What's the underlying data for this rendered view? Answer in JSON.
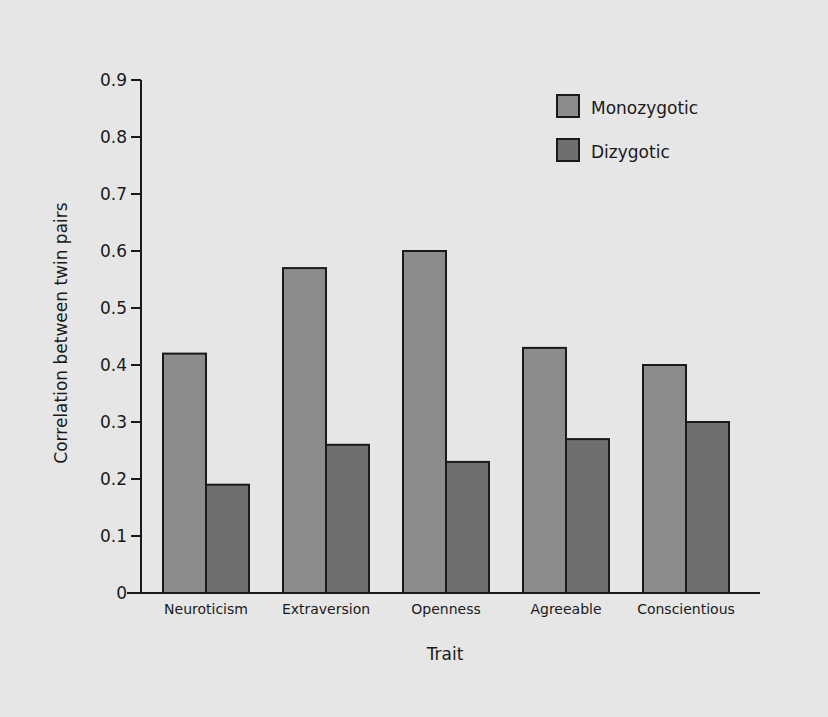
{
  "chart_data": {
    "type": "bar",
    "title": "",
    "xlabel": "Trait",
    "ylabel": "Correlation between twin pairs",
    "ylim": [
      0,
      0.9
    ],
    "yticks": [
      0,
      0.1,
      0.2,
      0.3,
      0.4,
      0.5,
      0.6,
      0.7,
      0.8,
      0.9
    ],
    "ytick_labels": [
      "0",
      "0.1",
      "0.2",
      "0.3",
      "0.4",
      "0.5",
      "0.6",
      "0.7",
      "0.8",
      "0.9"
    ],
    "grid": false,
    "legend_position": "top-right",
    "categories": [
      "Neuroticism",
      "Extraversion",
      "Openness",
      "Agreeable",
      "Conscientious"
    ],
    "series": [
      {
        "name": "Monozygotic",
        "color": "#8c8c8c",
        "values": [
          0.42,
          0.57,
          0.6,
          0.43,
          0.4
        ]
      },
      {
        "name": "Dizygotic",
        "color": "#6f6f6f",
        "values": [
          0.19,
          0.26,
          0.23,
          0.27,
          0.3
        ]
      }
    ]
  },
  "colors": {
    "background": "#e6e6e6",
    "axis": "#1a1a1a",
    "bar_outline": "#1a1a1a"
  }
}
